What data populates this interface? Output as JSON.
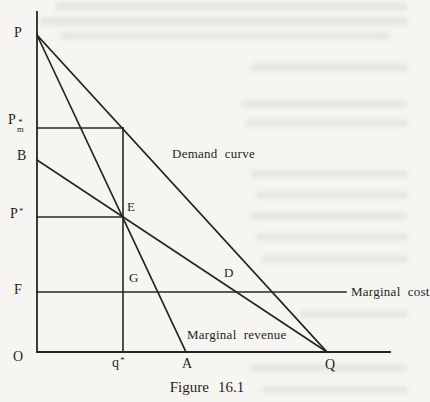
{
  "figure": {
    "caption": "Figure 16.1",
    "colors": {
      "paper": "#f6f5f2",
      "line": "#262626",
      "text": "#1f1f1f",
      "showthrough": "#dcdad3"
    },
    "labels": [
      {
        "name": "label-p",
        "text": "P",
        "x": 14,
        "y": 26,
        "size": 14
      },
      {
        "name": "label-pm-star",
        "base": "P",
        "sup": "*",
        "sub": "m",
        "x": 8,
        "y": 113,
        "size": 14
      },
      {
        "name": "label-b",
        "text": "B",
        "x": 17,
        "y": 149,
        "size": 14
      },
      {
        "name": "label-p-star",
        "base": "P",
        "sup": "*",
        "x": 10,
        "y": 207,
        "size": 14
      },
      {
        "name": "label-f",
        "text": "F",
        "x": 14,
        "y": 283,
        "size": 14
      },
      {
        "name": "label-o",
        "text": "O",
        "x": 13,
        "y": 350,
        "size": 14
      },
      {
        "name": "label-q-star",
        "base": "q",
        "sup": "*",
        "x": 112,
        "y": 356,
        "size": 14
      },
      {
        "name": "label-a",
        "text": "A",
        "x": 182,
        "y": 357,
        "size": 14
      },
      {
        "name": "label-q",
        "text": "Q",
        "x": 325,
        "y": 358,
        "size": 14
      },
      {
        "name": "label-e",
        "text": "E",
        "x": 127,
        "y": 200,
        "size": 13
      },
      {
        "name": "label-g",
        "text": "G",
        "x": 129,
        "y": 271,
        "size": 13
      },
      {
        "name": "label-d",
        "text": "D",
        "x": 224,
        "y": 266,
        "size": 13
      },
      {
        "name": "label-demand-curve",
        "text": "Demand curve",
        "x": 172,
        "y": 147,
        "size": 13
      },
      {
        "name": "label-marginal-cost",
        "text": "Marginal cost",
        "x": 351,
        "y": 285,
        "size": 13
      },
      {
        "name": "label-marginal-revenue",
        "text": "Marginal revenue",
        "x": 187,
        "y": 328,
        "size": 13
      }
    ],
    "lines": [
      {
        "name": "y-axis",
        "x1": 37,
        "y1": 12,
        "x2": 37,
        "y2": 352,
        "w": 1.8
      },
      {
        "name": "x-axis",
        "x1": 37,
        "y1": 352,
        "x2": 390,
        "y2": 352,
        "w": 1.8
      },
      {
        "name": "demand-curve-line",
        "x1": 37,
        "y1": 35,
        "x2": 327,
        "y2": 352,
        "w": 1.7
      },
      {
        "name": "marginal-revenue-line",
        "x1": 37,
        "y1": 35,
        "x2": 186,
        "y2": 352,
        "w": 1.7
      },
      {
        "name": "b-to-q-line",
        "x1": 37,
        "y1": 160,
        "x2": 327,
        "y2": 352,
        "w": 1.7
      },
      {
        "name": "marginal-cost-line",
        "x1": 37,
        "y1": 292,
        "x2": 346,
        "y2": 292,
        "w": 1.6
      },
      {
        "name": "pm-price-line",
        "x1": 37,
        "y1": 128,
        "x2": 123,
        "y2": 128,
        "w": 1.6
      },
      {
        "name": "p-star-price-line",
        "x1": 37,
        "y1": 217,
        "x2": 123,
        "y2": 217,
        "w": 1.6
      },
      {
        "name": "q-star-vertical-line",
        "x1": 123,
        "y1": 128,
        "x2": 123,
        "y2": 352,
        "w": 1.6
      }
    ],
    "showthrough": [
      {
        "x": 55,
        "y": 2,
        "w": 352,
        "h": 9
      },
      {
        "x": 40,
        "y": 17,
        "w": 368,
        "h": 9
      },
      {
        "x": 60,
        "y": 32,
        "w": 330,
        "h": 8
      },
      {
        "x": 250,
        "y": 63,
        "w": 158,
        "h": 9
      },
      {
        "x": 240,
        "y": 100,
        "w": 168,
        "h": 8
      },
      {
        "x": 246,
        "y": 119,
        "w": 162,
        "h": 8
      },
      {
        "x": 250,
        "y": 170,
        "w": 158,
        "h": 8
      },
      {
        "x": 256,
        "y": 191,
        "w": 152,
        "h": 8
      },
      {
        "x": 250,
        "y": 212,
        "w": 158,
        "h": 8
      },
      {
        "x": 256,
        "y": 233,
        "w": 152,
        "h": 8
      },
      {
        "x": 262,
        "y": 255,
        "w": 146,
        "h": 8
      },
      {
        "x": 300,
        "y": 310,
        "w": 108,
        "h": 8
      },
      {
        "x": 250,
        "y": 364,
        "w": 158,
        "h": 8
      },
      {
        "x": 262,
        "y": 386,
        "w": 146,
        "h": 8
      }
    ]
  }
}
